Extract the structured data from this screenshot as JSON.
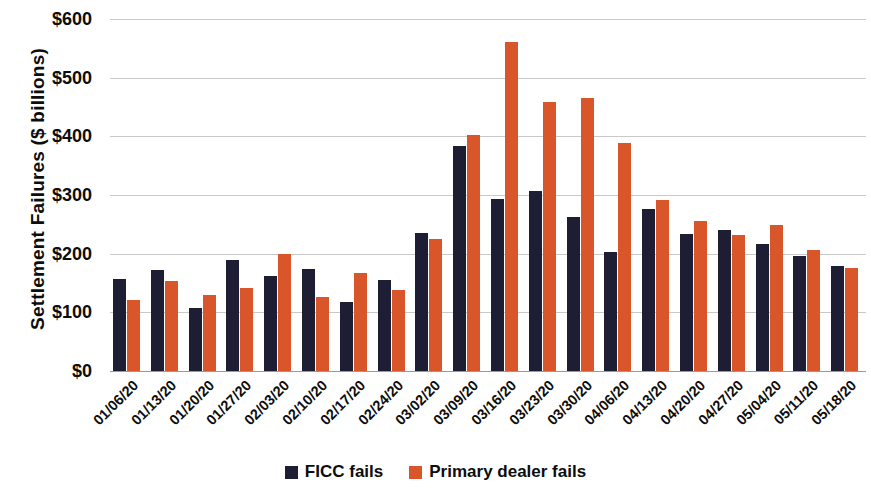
{
  "chart_data": {
    "type": "bar",
    "title": "",
    "xlabel": "",
    "ylabel": "Settlement Failures ($ billions)",
    "ylim": [
      0,
      600
    ],
    "ytick_step": 100,
    "ytick_labels": [
      "$600",
      "$500",
      "$400",
      "$300",
      "$200",
      "$100",
      "$0"
    ],
    "ytick_values": [
      600,
      500,
      400,
      300,
      200,
      100,
      0
    ],
    "grid": true,
    "legend_position": "bottom",
    "categories": [
      "01/06/20",
      "01/13/20",
      "01/20/20",
      "01/27/20",
      "02/03/20",
      "02/10/20",
      "02/17/20",
      "02/24/20",
      "03/02/20",
      "03/09/20",
      "03/16/20",
      "03/23/20",
      "03/30/20",
      "04/06/20",
      "04/13/20",
      "04/20/20",
      "04/27/20",
      "05/04/20",
      "05/11/20",
      "05/18/20"
    ],
    "series": [
      {
        "name": "FICC fails",
        "color": "#1d1d33",
        "values": [
          157,
          173,
          108,
          190,
          162,
          174,
          117,
          155,
          235,
          383,
          293,
          307,
          263,
          203,
          276,
          233,
          241,
          216,
          196,
          179
        ]
      },
      {
        "name": "Primary dealer fails",
        "color": "#d9562a",
        "values": [
          121,
          154,
          130,
          141,
          200,
          126,
          167,
          138,
          225,
          403,
          561,
          459,
          465,
          388,
          291,
          256,
          232,
          249,
          207,
          175
        ]
      }
    ]
  },
  "legend": {
    "items": [
      {
        "label": "FICC fails",
        "swatch": "ficc-swatch"
      },
      {
        "label": "Primary dealer fails",
        "swatch": "primary-dealer-swatch"
      }
    ]
  }
}
